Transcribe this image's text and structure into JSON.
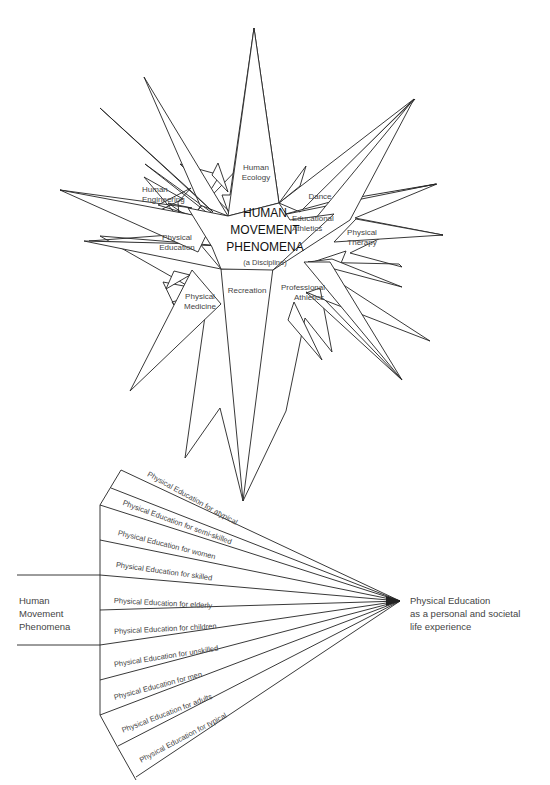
{
  "star": {
    "center": {
      "title_lines": [
        "HUMAN",
        "MOVEMENT",
        "PHENOMENA"
      ],
      "subtitle": "(a Discipline)"
    },
    "rays": [
      {
        "id": "human-ecology",
        "lines": [
          "Human",
          "Ecology"
        ]
      },
      {
        "id": "dance",
        "lines": [
          "Dance"
        ]
      },
      {
        "id": "educational-athletics",
        "lines": [
          "Educational",
          "Athletics"
        ]
      },
      {
        "id": "physical-therapy",
        "lines": [
          "Physical",
          "Therapy"
        ]
      },
      {
        "id": "professional-athletics",
        "lines": [
          "Professional",
          "Athletics"
        ]
      },
      {
        "id": "recreation",
        "lines": [
          "Recreation"
        ]
      },
      {
        "id": "physical-medicine",
        "lines": [
          "Physical",
          "Medicine"
        ]
      },
      {
        "id": "physical-education",
        "lines": [
          "Physical",
          "Education"
        ]
      },
      {
        "id": "human-engineering",
        "lines": [
          "Human",
          "Engineering"
        ]
      }
    ]
  },
  "fan": {
    "left_label": [
      "Human",
      "Movement",
      "Phenomena"
    ],
    "right_label": [
      "Physical Education",
      "as a personal and societal",
      "life experience"
    ],
    "segments": [
      "Physical Education for atypical",
      "Physical Education for semi-skilled",
      "Physical Education for women",
      "Physical Education for skilled",
      "Physical Education for elderly",
      "Physical Education for children",
      "Physical Education for unskilled",
      "Physical Education for men",
      "Physical Education for adults",
      "Physical Education for typical"
    ]
  },
  "caption_partial": "Figure (partially cut off at bottom edge)"
}
